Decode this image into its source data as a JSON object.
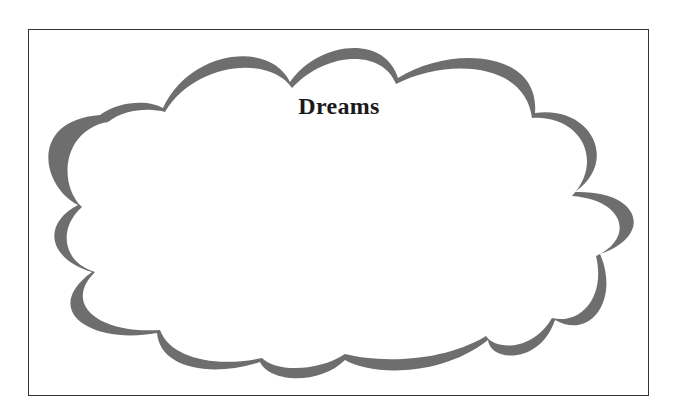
{
  "card": {
    "title": "Dreams",
    "colors": {
      "background": "#ffffff",
      "border": "#333333",
      "cloud_shadow": "#6e6e6e",
      "cloud_fill": "#ffffff",
      "title_text": "#1a1a1a"
    }
  }
}
